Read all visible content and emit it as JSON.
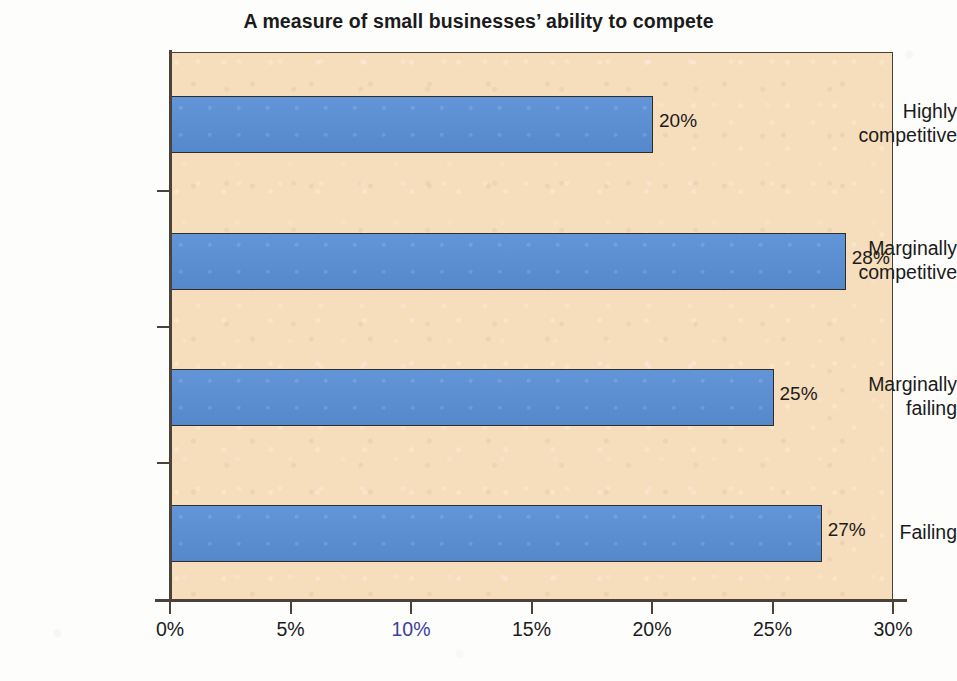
{
  "chart_data": {
    "type": "bar",
    "orientation": "horizontal",
    "title": "A measure of small businesses’ ability to compete",
    "xlabel": "",
    "ylabel": "",
    "categories": [
      "Highly competitive",
      "Marginally competitive",
      "Marginally failing",
      "Failing"
    ],
    "category_lines": [
      [
        "Highly",
        "competitive"
      ],
      [
        "Marginally",
        "competitive"
      ],
      [
        "Marginally",
        "failing"
      ],
      [
        "Failing",
        ""
      ]
    ],
    "values": [
      20,
      28,
      25,
      27
    ],
    "value_labels": [
      "20%",
      "28%",
      "25%",
      "27%"
    ],
    "xlim": [
      0,
      30
    ],
    "xticks": [
      0,
      5,
      10,
      15,
      20,
      25,
      30
    ],
    "xtick_labels": [
      "0%",
      "5%",
      "10%",
      "15%",
      "20%",
      "25%",
      "30%"
    ],
    "grid": false,
    "legend": null,
    "colors": {
      "bar_fill": "#5a8fd6",
      "bar_outline": "#2d2d2d",
      "plot_background": "#f6ddbb",
      "axis": "#4a423b",
      "text": "#1b1b1b",
      "page_background": "#fdfdfc"
    }
  }
}
